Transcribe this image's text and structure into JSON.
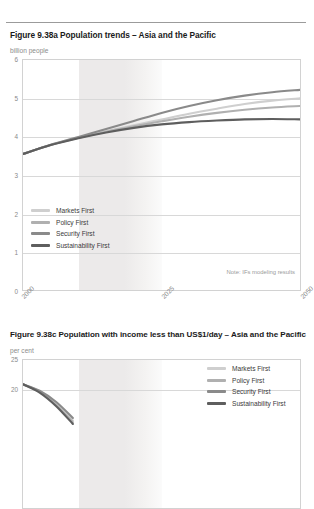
{
  "charts": [
    {
      "title": "Figure 9.38a Population trends – Asia and the Pacific",
      "unit": "billion people",
      "note": "Note: IFs modeling results",
      "chart_data": {
        "type": "line",
        "title": "Figure 9.38a Population trends – Asia and the Pacific",
        "xlabel": "",
        "ylabel": "billion people",
        "xlim": [
          2000,
          2050
        ],
        "ylim": [
          0,
          6
        ],
        "yticks": [
          0,
          1,
          2,
          3,
          4,
          5,
          6
        ],
        "xticks": [
          2000,
          2025,
          2050
        ],
        "xtick_labels": [
          "2000",
          "2025",
          "2050"
        ],
        "grid": true,
        "legend_position": "inside-lower-left",
        "shaded_band": {
          "from": 2010,
          "to": 2025,
          "label": ""
        },
        "x": [
          2000,
          2005,
          2010,
          2015,
          2020,
          2025,
          2030,
          2035,
          2040,
          2045,
          2050
        ],
        "series": [
          {
            "name": "Markets First",
            "color": "#cfcfcf",
            "values": [
              3.55,
              3.78,
              3.97,
              4.14,
              4.3,
              4.45,
              4.6,
              4.73,
              4.85,
              4.94,
              5.0
            ]
          },
          {
            "name": "Policy First",
            "color": "#b0b0b0",
            "values": [
              3.55,
              3.78,
              3.97,
              4.13,
              4.27,
              4.4,
              4.52,
              4.62,
              4.7,
              4.76,
              4.8
            ]
          },
          {
            "name": "Security First",
            "color": "#8a8a8a",
            "values": [
              3.55,
              3.79,
              3.99,
              4.2,
              4.41,
              4.62,
              4.8,
              4.95,
              5.07,
              5.16,
              5.22
            ]
          },
          {
            "name": "Sustainability First",
            "color": "#5e5e5e",
            "values": [
              3.55,
              3.78,
              3.96,
              4.11,
              4.23,
              4.32,
              4.38,
              4.42,
              4.45,
              4.46,
              4.45
            ]
          }
        ]
      }
    },
    {
      "title": "Figure 9.38c Population with income less than US$1/day – Asia and the Pacific",
      "unit": "per cent",
      "note": "",
      "chart_data": {
        "type": "line",
        "title": "Figure 9.38c Population with income less than US$1/day – Asia and the Pacific",
        "xlabel": "",
        "ylabel": "per cent",
        "xlim": [
          2000,
          2050
        ],
        "ylim": [
          0,
          25
        ],
        "yticks": [
          20,
          25
        ],
        "ytick_labels": [
          "20",
          "25"
        ],
        "xticks": [],
        "xtick_labels": [],
        "grid": true,
        "legend_position": "inside-upper-right",
        "shaded_band": {
          "from": 2010,
          "to": 2025,
          "label": ""
        },
        "x": [
          2000,
          2003,
          2006,
          2009
        ],
        "series": [
          {
            "name": "Markets First",
            "color": "#cfcfcf",
            "values": [
              20.9,
              19.7,
              17.6,
              14.8
            ]
          },
          {
            "name": "Policy First",
            "color": "#b0b0b0",
            "values": [
              20.9,
              19.6,
              17.4,
              14.5
            ]
          },
          {
            "name": "Security First",
            "color": "#8a8a8a",
            "values": [
              20.9,
              19.8,
              17.9,
              15.2
            ]
          },
          {
            "name": "Sustainability First",
            "color": "#5e5e5e",
            "values": [
              20.9,
              19.5,
              17.2,
              14.2
            ]
          }
        ]
      }
    }
  ],
  "legend": {
    "items": [
      {
        "label": "Markets First",
        "color": "#cfcfcf"
      },
      {
        "label": "Policy First",
        "color": "#b0b0b0"
      },
      {
        "label": "Security First",
        "color": "#8a8a8a"
      },
      {
        "label": "Sustainability First",
        "color": "#5e5e5e"
      }
    ]
  }
}
